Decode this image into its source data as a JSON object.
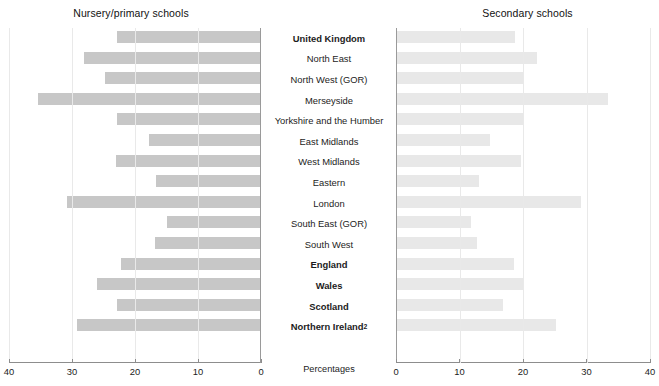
{
  "chart_data": {
    "type": "bar",
    "orientation": "horizontal",
    "layout": "back-to-back paired panels",
    "title_left": "Nursery/primary schools",
    "title_right": "Secondary schools",
    "xlabel": "Percentages",
    "ylabel": "",
    "xlim_left": [
      40,
      0
    ],
    "xlim_right": [
      0,
      40
    ],
    "grid": true,
    "legend": "none",
    "tick_values_left": [
      40,
      30,
      20,
      10,
      0
    ],
    "tick_labels_left": [
      "40",
      "30",
      "20",
      "10",
      "0"
    ],
    "tick_values_right": [
      0,
      10,
      20,
      30,
      40
    ],
    "tick_labels_right": [
      "0",
      "10",
      "20",
      "30",
      "40"
    ],
    "categories": [
      "United Kingdom",
      "North East",
      "North West (GOR)",
      "Merseyside",
      "Yorkshire and the Humber",
      "East Midlands",
      "West Midlands",
      "Eastern",
      "London",
      "South East (GOR)",
      "South West",
      "England",
      "Wales",
      "Scotland",
      "Northern Ireland"
    ],
    "category_labels": [
      "United Kingdom",
      "North East",
      "North West (GOR)",
      "Merseyside",
      "Yorkshire and the Humber",
      "East Midlands",
      "West Midlands",
      "Eastern",
      "London",
      "South East (GOR)",
      "South West",
      "England",
      "Wales",
      "Scotland",
      "Northern Ireland"
    ],
    "category_footnotes": [
      "",
      "",
      "",
      "",
      "",
      "",
      "",
      "",
      "",
      "",
      "",
      "",
      "",
      "",
      "2"
    ],
    "category_bold": [
      true,
      false,
      false,
      false,
      false,
      false,
      false,
      false,
      false,
      false,
      false,
      true,
      true,
      true,
      true
    ],
    "series": [
      {
        "name": "Nursery/primary schools",
        "panel": "left",
        "color": "#c7c7c7",
        "values": [
          22.9,
          28.1,
          24.8,
          35.4,
          22.9,
          17.8,
          23.0,
          16.7,
          30.8,
          14.9,
          16.8,
          22.2,
          26.1,
          22.9,
          29.2
        ]
      },
      {
        "name": "Secondary schools",
        "panel": "right",
        "color": "#e8e8e8",
        "values": [
          18.7,
          22.2,
          20.2,
          33.4,
          20.0,
          14.8,
          19.7,
          13.1,
          29.1,
          11.8,
          12.8,
          18.6,
          20.0,
          16.9,
          25.2
        ]
      }
    ]
  },
  "colors": {
    "left_bar": "#c7c7c7",
    "right_bar": "#e8e8e8",
    "gridline": "#e9e9e9",
    "axis": "#8d8d8d",
    "text": "#1c1c1c",
    "background": "#ffffff"
  }
}
